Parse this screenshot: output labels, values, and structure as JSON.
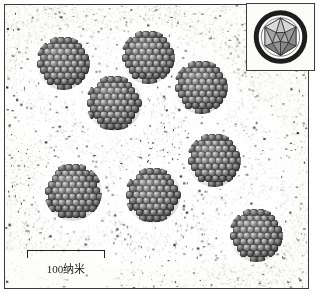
{
  "figure": {
    "kind": "electron-micrograph",
    "background_color": "#fdfdfc",
    "frame_color": "#3a3a3a",
    "particle_color": "#4a4a4a"
  },
  "scale": {
    "label": "100纳米",
    "bar_length_px": 78,
    "value": 100,
    "unit": "纳米"
  },
  "inset": {
    "name": "icosahedron-model",
    "ring_color": "#1e1e1e",
    "face_light": "#d5d5d5",
    "face_mid": "#a6a6a6",
    "face_dark": "#6e6e6e"
  },
  "chart_data": {
    "type": "scatter",
    "title": "",
    "xlabel": "",
    "ylabel": "",
    "grid": false,
    "legend": "none",
    "xlim": [
      0,
      305
    ],
    "ylim": [
      0,
      285
    ],
    "units": "pixels (scale: 78 px = 100 纳米)",
    "series": [
      {
        "name": "nanoparticle-clusters",
        "count": 8,
        "points": [
          {
            "id": 1,
            "x": 58,
            "y": 58,
            "d": 54
          },
          {
            "id": 2,
            "x": 143,
            "y": 52,
            "d": 54
          },
          {
            "id": 3,
            "x": 196,
            "y": 82,
            "d": 54
          },
          {
            "id": 4,
            "x": 109,
            "y": 98,
            "d": 56
          },
          {
            "id": 5,
            "x": 209,
            "y": 155,
            "d": 54
          },
          {
            "id": 6,
            "x": 68,
            "y": 187,
            "d": 58
          },
          {
            "id": 7,
            "x": 148,
            "y": 190,
            "d": 56
          },
          {
            "id": 8,
            "x": 251,
            "y": 230,
            "d": 54
          }
        ]
      }
    ],
    "halos": [
      {
        "x": 120,
        "y": 95,
        "rx": 130,
        "ry": 78
      },
      {
        "x": 150,
        "y": 195,
        "rx": 140,
        "ry": 72
      },
      {
        "x": 225,
        "y": 175,
        "rx": 70,
        "ry": 85
      }
    ]
  }
}
